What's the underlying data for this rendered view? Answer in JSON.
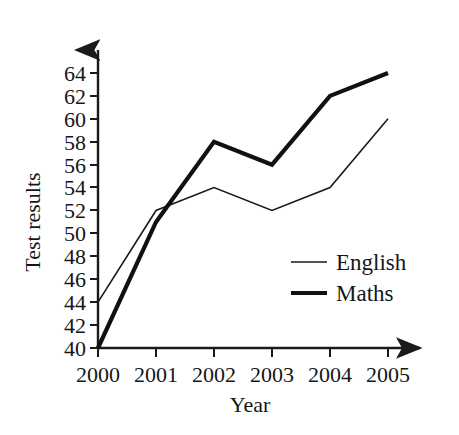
{
  "chart_data": {
    "type": "line",
    "title": "",
    "xlabel": "Year",
    "ylabel": "Test results",
    "categories": [
      "2000",
      "2001",
      "2002",
      "2003",
      "2004",
      "2005"
    ],
    "x": [
      2000,
      2001,
      2002,
      2003,
      2004,
      2005
    ],
    "xlim": [
      2000,
      2005
    ],
    "ylim": [
      40,
      64
    ],
    "ytick_labels": [
      "40",
      "42",
      "44",
      "46",
      "48",
      "50",
      "52",
      "54",
      "56",
      "58",
      "60",
      "62",
      "64"
    ],
    "yticks": [
      40,
      42,
      44,
      46,
      48,
      50,
      52,
      54,
      56,
      58,
      60,
      62,
      64
    ],
    "xtick_labels": [
      "2000",
      "2001",
      "2002",
      "2003",
      "2004",
      "2005"
    ],
    "grid": false,
    "legend_position": "inside-right-lower",
    "series": [
      {
        "name": "English",
        "values": [
          44,
          52,
          54,
          52,
          54,
          60
        ],
        "color": "#1a1a1a",
        "line_width": 1.6
      },
      {
        "name": "Maths",
        "values": [
          40,
          51,
          58,
          56,
          62,
          64
        ],
        "color": "#111111",
        "line_width": 4.2
      }
    ],
    "legend": [
      {
        "label": "English",
        "swatch": "thin-line"
      },
      {
        "label": "Maths",
        "swatch": "thick-line"
      }
    ],
    "axis_style": {
      "x_arrow": true,
      "y_arrow": true,
      "axis_color": "#1a1a1a"
    }
  }
}
